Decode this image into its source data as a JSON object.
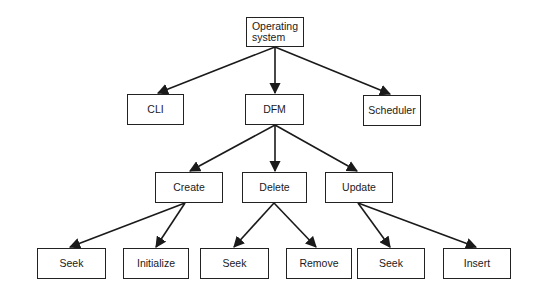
{
  "diagram": {
    "type": "tree",
    "nodes": {
      "root": {
        "label": "Operating system",
        "line1": "Operating",
        "line2": "system"
      },
      "cli": {
        "label": "CLI"
      },
      "dfm": {
        "label": "DFM"
      },
      "scheduler": {
        "label": "Scheduler"
      },
      "create": {
        "label": "Create"
      },
      "delete": {
        "label": "Delete"
      },
      "update": {
        "label": "Update"
      },
      "create_seek": {
        "label": "Seek"
      },
      "create_initialize": {
        "label": "Initialize"
      },
      "delete_seek": {
        "label": "Seek"
      },
      "delete_remove": {
        "label": "Remove"
      },
      "update_seek": {
        "label": "Seek"
      },
      "update_insert": {
        "label": "Insert"
      }
    },
    "edges": [
      [
        "root",
        "cli"
      ],
      [
        "root",
        "dfm"
      ],
      [
        "root",
        "scheduler"
      ],
      [
        "dfm",
        "create"
      ],
      [
        "dfm",
        "delete"
      ],
      [
        "dfm",
        "update"
      ],
      [
        "create",
        "create_seek"
      ],
      [
        "create",
        "create_initialize"
      ],
      [
        "delete",
        "delete_seek"
      ],
      [
        "delete",
        "delete_remove"
      ],
      [
        "update",
        "update_seek"
      ],
      [
        "update",
        "update_insert"
      ]
    ]
  }
}
